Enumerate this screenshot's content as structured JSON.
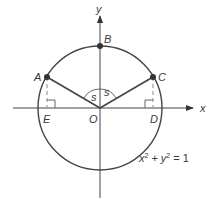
{
  "diagram": {
    "axes": {
      "x_label": "x",
      "y_label": "y"
    },
    "points": {
      "A": "A",
      "B": "B",
      "C": "C",
      "D": "D",
      "E": "E",
      "O": "O"
    },
    "angle_labels": {
      "left": "s",
      "right": "s"
    },
    "equation": {
      "base_x": "x",
      "sup_x": "2",
      "plus": "+",
      "base_y": "y",
      "sup_y": "2",
      "rhs": "= 1"
    },
    "colors": {
      "stroke": "#3a3a3a",
      "dashed": "#8a8a8a",
      "point": "#333333"
    }
  }
}
